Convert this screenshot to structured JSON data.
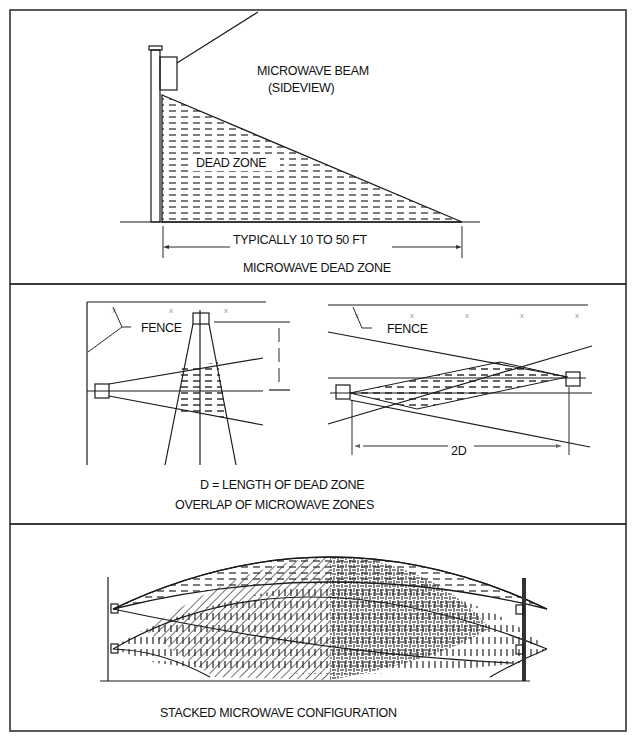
{
  "panels": [
    {
      "id": "dead-zone",
      "labels": {
        "beam": "MICROWAVE BEAM",
        "beam_sub": "(SIDEVIEW)",
        "zone": "DEAD ZONE",
        "dimension": "TYPICALLY 10 TO 50 FT",
        "caption": "MICROWAVE DEAD ZONE"
      }
    },
    {
      "id": "overlap",
      "labels": {
        "fence_left": "FENCE",
        "fence_right": "FENCE",
        "dimension": "2D",
        "definition": "D =  LENGTH OF DEAD ZONE",
        "caption": "OVERLAP OF MICROWAVE ZONES"
      },
      "fence_marks": [
        "x",
        "x",
        "x",
        "x",
        "x",
        "x",
        "x",
        "x"
      ]
    },
    {
      "id": "stacked",
      "labels": {
        "caption": "STACKED MICROWAVE CONFIGURATION"
      }
    }
  ],
  "colors": {
    "line": "#1a1a1a",
    "frame": "#333333",
    "background": "#ffffff",
    "fence_mark": "#888888"
  }
}
